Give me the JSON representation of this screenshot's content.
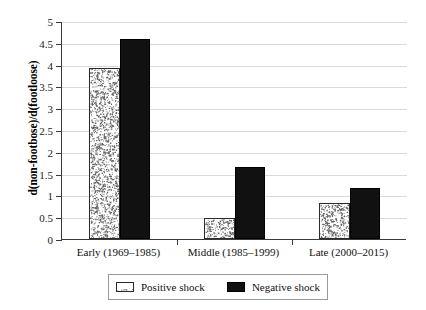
{
  "chart_data": {
    "type": "bar",
    "title": "",
    "xlabel": "",
    "ylabel": "d(non-footbose)/d(footloose)",
    "categories": [
      "Early (1969–1985)",
      "Middle (1985–1999)",
      "Late (2000–2015)"
    ],
    "series": [
      {
        "name": "Positive shock",
        "values": [
          3.93,
          0.48,
          0.83
        ],
        "fill": "speckled",
        "color": "#ffffff"
      },
      {
        "name": "Negative shock",
        "values": [
          4.59,
          1.65,
          1.17
        ],
        "fill": "solid",
        "color": "#111111"
      }
    ],
    "ylim": [
      0,
      5
    ],
    "yticks": [
      0,
      0.5,
      1,
      1.5,
      2,
      2.5,
      3,
      3.5,
      4,
      4.5,
      5
    ],
    "ytick_labels": [
      "0",
      "0.5",
      "1",
      "1.5",
      "2",
      "2.5",
      "3",
      "3.5",
      "4",
      "4.5",
      "5"
    ],
    "grid": true,
    "legend_position": "bottom-center",
    "legend_entries": [
      "Positive shock",
      "Negative shock"
    ]
  }
}
